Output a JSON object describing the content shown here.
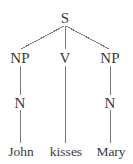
{
  "figure": {
    "type": "syntax-tree",
    "cropped_top_text": "",
    "background_color": "#ffffff",
    "line_color": "#7a7a7a",
    "text_color": "#3a3a3a",
    "sentence": "John kisses Mary"
  },
  "nodes": [
    {
      "id": "s",
      "label": "S",
      "level": 0,
      "x": 65,
      "y": 18,
      "kind": "category"
    },
    {
      "id": "np-left",
      "label": "NP",
      "level": 1,
      "x": 20,
      "y": 58,
      "kind": "category"
    },
    {
      "id": "v",
      "label": "V",
      "level": 1,
      "x": 65,
      "y": 58,
      "kind": "category"
    },
    {
      "id": "np-right",
      "label": "NP",
      "level": 1,
      "x": 110,
      "y": 58,
      "kind": "category"
    },
    {
      "id": "n-left",
      "label": "N",
      "level": 2,
      "x": 20,
      "y": 103,
      "kind": "category"
    },
    {
      "id": "n-right",
      "label": "N",
      "level": 2,
      "x": 110,
      "y": 103,
      "kind": "category"
    },
    {
      "id": "john",
      "label": "John",
      "level": 3,
      "x": 21,
      "y": 152,
      "kind": "leaf"
    },
    {
      "id": "kisses",
      "label": "kisses",
      "level": 3,
      "x": 66,
      "y": 152,
      "kind": "leaf"
    },
    {
      "id": "mary",
      "label": "Mary",
      "level": 3,
      "x": 111,
      "y": 152,
      "kind": "leaf"
    }
  ],
  "edges": [
    {
      "id": "s-np-left",
      "from": "s",
      "to": "np-left",
      "x1": 64,
      "y1": 26,
      "x2": 21,
      "y2": 49
    },
    {
      "id": "s-v",
      "from": "s",
      "to": "v",
      "x1": 65,
      "y1": 26,
      "x2": 65,
      "y2": 49
    },
    {
      "id": "s-np-right",
      "from": "s",
      "to": "np-right",
      "x1": 66,
      "y1": 26,
      "x2": 109,
      "y2": 49
    },
    {
      "id": "np-left-n",
      "from": "np-left",
      "to": "n-left",
      "x1": 20,
      "y1": 66,
      "x2": 20,
      "y2": 95
    },
    {
      "id": "v-kisses",
      "from": "v",
      "to": "kisses",
      "x1": 65,
      "y1": 66,
      "x2": 65,
      "y2": 143
    },
    {
      "id": "np-right-n",
      "from": "np-right",
      "to": "n-right",
      "x1": 110,
      "y1": 66,
      "x2": 110,
      "y2": 95
    },
    {
      "id": "n-left-john",
      "from": "n-left",
      "to": "john",
      "x1": 20,
      "y1": 110,
      "x2": 20,
      "y2": 143
    },
    {
      "id": "n-right-mary",
      "from": "n-right",
      "to": "mary",
      "x1": 110,
      "y1": 110,
      "x2": 110,
      "y2": 143
    }
  ]
}
